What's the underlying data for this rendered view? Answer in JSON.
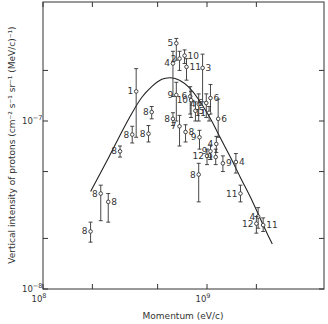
{
  "chart_data": {
    "type": "scatter",
    "title": "",
    "xlabel": "Momentum (eV/c)",
    "ylabel": "Vertical intensity of protons (cm⁻² s⁻¹ sr⁻¹ (MeV/c)⁻¹)",
    "xscale": "log",
    "yscale": "log",
    "xlim": [
      100000000.0,
      5000000000.0
    ],
    "ylim": [
      1e-08,
      3.5e-07
    ],
    "grid": false,
    "legend": "none (points labelled by reference number)",
    "x_tick_labels": [
      {
        "value": 100000000.0,
        "label": "10",
        "exp": "8"
      },
      {
        "value": 1000000000.0,
        "label": "10",
        "exp": "9"
      }
    ],
    "y_tick_labels": [
      {
        "value": 1e-07,
        "label": "10",
        "exp": "−7"
      },
      {
        "value": 1e-08,
        "label": "10",
        "exp": "−8"
      }
    ],
    "x_minor_ticks": [
      200000000.0,
      500000000.0,
      2000000000.0
    ],
    "y_minor_ticks": [
      2e-08,
      5e-08,
      2e-07
    ],
    "points": [
      {
        "ref": "8",
        "x": 195000000.0,
        "y": 2.2e-08,
        "ylo": 1.9e-08,
        "yhi": 2.5e-08,
        "side": "left"
      },
      {
        "ref": "8",
        "x": 225000000.0,
        "y": 3.7e-08,
        "ylo": 2.55e-08,
        "yhi": 4.15e-08,
        "side": "left"
      },
      {
        "ref": "8",
        "x": 250000000.0,
        "y": 3.3e-08,
        "ylo": 2.5e-08,
        "yhi": 3.7e-08,
        "side": "right"
      },
      {
        "ref": "8",
        "x": 295000000.0,
        "y": 6.6e-08,
        "ylo": 6.1e-08,
        "yhi": 7.1e-08,
        "side": "left"
      },
      {
        "ref": "8",
        "x": 350000000.0,
        "y": 8.3e-08,
        "ylo": 7.4e-08,
        "yhi": 9.3e-08,
        "side": "left"
      },
      {
        "ref": "1",
        "x": 370000000.0,
        "y": 1.5e-07,
        "ylo": 8e-08,
        "yhi": 2.05e-07,
        "side": "left"
      },
      {
        "ref": "8",
        "x": 440000000.0,
        "y": 8.4e-08,
        "ylo": 7.5e-08,
        "yhi": 9.4e-08,
        "side": "left"
      },
      {
        "ref": "8",
        "x": 460000000.0,
        "y": 1.13e-07,
        "ylo": 1.03e-07,
        "yhi": 1.22e-07,
        "side": "left"
      },
      {
        "ref": "4",
        "x": 620000000.0,
        "y": 2.2e-07,
        "ylo": 1.4e-07,
        "yhi": 2.6e-07,
        "side": "left"
      },
      {
        "ref": "5",
        "x": 650000000.0,
        "y": 2.9e-07,
        "ylo": 2.3e-07,
        "yhi": 3.1e-07,
        "side": "left"
      },
      {
        "ref": "8",
        "x": 620000000.0,
        "y": 1.03e-07,
        "ylo": 9.4e-08,
        "yhi": 1.12e-07,
        "side": "left"
      },
      {
        "ref": "9",
        "x": 650000000.0,
        "y": 1.43e-07,
        "ylo": 1e-07,
        "yhi": 1.7e-07,
        "side": "left"
      },
      {
        "ref": "7",
        "x": 680000000.0,
        "y": 9.3e-08,
        "ylo": 7.1e-08,
        "yhi": 1.08e-07,
        "side": "left"
      },
      {
        "ref": "2",
        "x": 680000000.0,
        "y": 2.35e-07,
        "ylo": 2e-07,
        "yhi": 2.6e-07,
        "side": "left"
      },
      {
        "ref": "10",
        "x": 730000000.0,
        "y": 2.45e-07,
        "ylo": 2.2e-07,
        "yhi": 2.65e-07,
        "side": "right"
      },
      {
        "ref": "11",
        "x": 750000000.0,
        "y": 2.1e-07,
        "ylo": 1.75e-07,
        "yhi": 2.35e-07,
        "side": "right"
      },
      {
        "ref": "6",
        "x": 790000000.0,
        "y": 1.4e-07,
        "ylo": 1.1e-07,
        "yhi": 1.6e-07,
        "side": "left"
      },
      {
        "ref": "10",
        "x": 800000000.0,
        "y": 1.33e-07,
        "ylo": 1.05e-07,
        "yhi": 1.5e-07,
        "side": "left"
      },
      {
        "ref": "8",
        "x": 740000000.0,
        "y": 8.6e-08,
        "ylo": 7.5e-08,
        "yhi": 9.5e-08,
        "side": "right"
      },
      {
        "ref": "9",
        "x": 900000000.0,
        "y": 8e-08,
        "ylo": 6.8e-08,
        "yhi": 8.8e-08,
        "side": "left"
      },
      {
        "ref": "3",
        "x": 940000000.0,
        "y": 2.07e-07,
        "ylo": 1.3e-07,
        "yhi": 2.5e-07,
        "side": "right"
      },
      {
        "ref": "4",
        "x": 890000000.0,
        "y": 1.26e-07,
        "ylo": 1e-07,
        "yhi": 1.45e-07,
        "side": "left"
      },
      {
        "ref": "5",
        "x": 850000000.0,
        "y": 1.15e-07,
        "ylo": 1e-07,
        "yhi": 1.3e-07,
        "side": "right"
      },
      {
        "ref": "6",
        "x": 990000000.0,
        "y": 1.28e-07,
        "ylo": 1.05e-07,
        "yhi": 1.45e-07,
        "side": "left"
      },
      {
        "ref": "6",
        "x": 1050000000.0,
        "y": 1.37e-07,
        "ylo": 1.1e-07,
        "yhi": 1.65e-07,
        "side": "right"
      },
      {
        "ref": "11",
        "x": 1030000000.0,
        "y": 1.12e-07,
        "ylo": 1e-07,
        "yhi": 1.22e-07,
        "side": "left"
      },
      {
        "ref": "6",
        "x": 1170000000.0,
        "y": 1.03e-07,
        "ylo": 8e-08,
        "yhi": 1.35e-07,
        "side": "right"
      },
      {
        "ref": "8",
        "x": 890000000.0,
        "y": 4.8e-08,
        "ylo": 3.3e-08,
        "yhi": 5.6e-08,
        "side": "left"
      },
      {
        "ref": "12",
        "x": 1000000000.0,
        "y": 6.2e-08,
        "ylo": 5.5e-08,
        "yhi": 6.8e-08,
        "side": "left"
      },
      {
        "ref": "9",
        "x": 1050000000.0,
        "y": 6.6e-08,
        "ylo": 5.9e-08,
        "yhi": 7.2e-08,
        "side": "left"
      },
      {
        "ref": "4",
        "x": 1140000000.0,
        "y": 7.3e-08,
        "ylo": 6.5e-08,
        "yhi": 8.1e-08,
        "side": "left"
      },
      {
        "ref": "9",
        "x": 1130000000.0,
        "y": 6.1e-08,
        "ylo": 5.5e-08,
        "yhi": 6.8e-08,
        "side": "left"
      },
      {
        "ref": "9",
        "x": 1250000000.0,
        "y": 5.6e-08,
        "ylo": 5e-08,
        "yhi": 6.2e-08,
        "side": "right"
      },
      {
        "ref": "4",
        "x": 1500000000.0,
        "y": 5.7e-08,
        "ylo": 4.9e-08,
        "yhi": 6.4e-08,
        "side": "right"
      },
      {
        "ref": "11",
        "x": 1600000000.0,
        "y": 3.7e-08,
        "ylo": 3.3e-08,
        "yhi": 4.15e-08,
        "side": "left"
      },
      {
        "ref": "4",
        "x": 2050000000.0,
        "y": 2.7e-08,
        "ylo": 2.3e-08,
        "yhi": 3.05e-08,
        "side": "left"
      },
      {
        "ref": "12",
        "x": 2000000000.0,
        "y": 2.45e-08,
        "ylo": 2.15e-08,
        "yhi": 2.7e-08,
        "side": "left"
      },
      {
        "ref": "11",
        "x": 2200000000.0,
        "y": 2.4e-08,
        "ylo": 2.2e-08,
        "yhi": 2.65e-08,
        "side": "right"
      }
    ],
    "curve": {
      "name": "theoretical spectrum",
      "x": [
        195000000.0,
        250000000.0,
        300000000.0,
        350000000.0,
        400000000.0,
        460000000.0,
        530000000.0,
        600000000.0,
        680000000.0,
        780000000.0,
        900000000.0,
        1050000000.0,
        1200000000.0,
        1400000000.0,
        1600000000.0,
        1900000000.0,
        2200000000.0,
        2500000000.0
      ],
      "y": [
        3.8e-08,
        6e-08,
        8.5e-08,
        1.12e-07,
        1.38e-07,
        1.6e-07,
        1.77e-07,
        1.81e-07,
        1.75e-07,
        1.58e-07,
        1.32e-07,
        1.03e-07,
        8e-08,
        6e-08,
        4.6e-08,
        3.3e-08,
        2.4e-08,
        1.85e-08
      ]
    }
  }
}
